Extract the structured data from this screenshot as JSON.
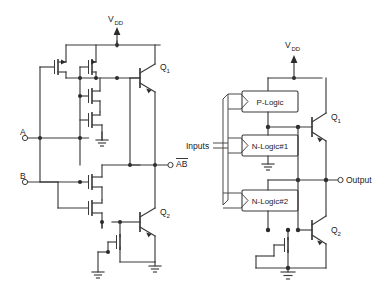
{
  "figure": {
    "panels": [
      {
        "id": "left",
        "name": "BiCMOS NAND gate",
        "supply_label": "V",
        "supply_sub": "DD",
        "inputs": [
          {
            "label": "A",
            "terminal": "open-circle"
          },
          {
            "label": "B",
            "terminal": "open-circle"
          }
        ],
        "output": {
          "label": "AB",
          "overbar": true,
          "terminal": "open-circle"
        },
        "devices": [
          {
            "label": "Q",
            "sub": "1",
            "type": "npn-bjt"
          },
          {
            "label": "Q",
            "sub": "2",
            "type": "npn-bjt"
          }
        ],
        "icons": [
          "pmos-transistor-icon",
          "nmos-transistor-icon",
          "ground-icon",
          "supply-arrow-icon",
          "junction-dot-icon"
        ]
      },
      {
        "id": "right",
        "name": "Generalized BiCMOS gate block diagram",
        "supply_label": "V",
        "supply_sub": "DD",
        "inputs_label": "Inputs",
        "output_label": "Output",
        "blocks": [
          {
            "label": "P-Logic"
          },
          {
            "label": "N-Logic#1"
          },
          {
            "label": "N-Logic#2"
          }
        ],
        "devices": [
          {
            "label": "Q",
            "sub": "1",
            "type": "npn-bjt"
          },
          {
            "label": "Q",
            "sub": "2",
            "type": "npn-bjt"
          }
        ],
        "icons": [
          "nmos-transistor-icon",
          "ground-icon",
          "supply-arrow-icon",
          "bus-arrow-icon",
          "junction-dot-icon"
        ]
      }
    ],
    "colors": {
      "wire": "#3a3a3a",
      "text": "#222222",
      "background": "#ffffff",
      "node": "#2b2b2b"
    }
  }
}
